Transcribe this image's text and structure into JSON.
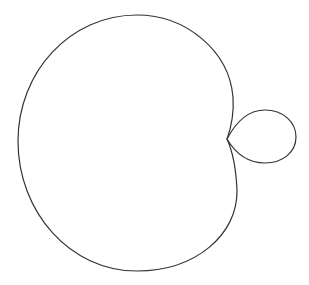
{
  "figure": {
    "stroke_color": "#333333",
    "background_color": "#ffffff",
    "crossing_point": [
      227,
      139
    ],
    "large_lobe": {
      "top": [
        137,
        15
      ],
      "left": [
        18,
        141
      ],
      "bottom": [
        137,
        271
      ],
      "upper_right": [
        233,
        97
      ],
      "lower_right": [
        237,
        190
      ]
    },
    "small_loop": {
      "top": [
        265,
        110
      ],
      "right": [
        296,
        137
      ],
      "bottom": [
        265,
        163
      ]
    }
  }
}
